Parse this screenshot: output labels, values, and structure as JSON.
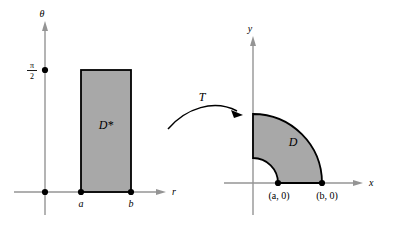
{
  "figure": {
    "background_color": "#ffffff",
    "fill_color": "#a8a8a8",
    "stroke_color": "#000000",
    "axis_color": "#949494"
  },
  "left_plot": {
    "name": "polar-parameter-plane",
    "vertical_axis_label": "θ",
    "horizontal_axis_label": "r",
    "tick": {
      "label_numerator": "π",
      "label_denominator": "2",
      "value": "π/2"
    },
    "origin_dot": "origin",
    "region_label": "D*",
    "x_tick_labels": [
      "a",
      "b"
    ],
    "rectangle": {
      "left_label": "a",
      "right_label": "b",
      "top_label": "π/2",
      "bottom_label": "0"
    }
  },
  "arrow": {
    "label": "T"
  },
  "right_plot": {
    "name": "cartesian-xy-plane",
    "vertical_axis_label": "y",
    "horizontal_axis_label": "x",
    "region_label": "D",
    "point_labels": [
      "(a, 0)",
      "(b, 0)"
    ],
    "inner_radius_label": "a",
    "outer_radius_label": "b"
  }
}
